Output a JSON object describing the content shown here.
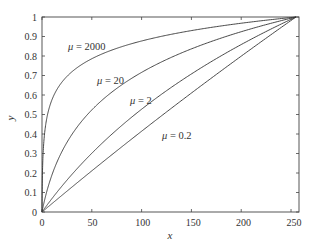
{
  "chart_data": {
    "type": "line",
    "title": "",
    "xlabel": "x",
    "ylabel": "y",
    "xlim": [
      0,
      255
    ],
    "ylim": [
      0,
      1
    ],
    "grid": false,
    "legend": "inline annotations",
    "xticks": [
      "0",
      "50",
      "100",
      "150",
      "200",
      "250"
    ],
    "yticks": [
      "0",
      "0.1",
      "0.2",
      "0.3",
      "0.4",
      "0.5",
      "0.6",
      "0.7",
      "0.8",
      "0.9",
      "1"
    ],
    "formula": "y = ln(1 + mu*x/255) / ln(1 + mu)",
    "series": [
      {
        "name": "μ = 2000",
        "mu": 2000,
        "x": [
          0,
          5,
          25,
          50,
          100,
          150,
          200,
          255
        ],
        "values": [
          0,
          0.49,
          0.68,
          0.76,
          0.85,
          0.9,
          0.97,
          1.0
        ]
      },
      {
        "name": "μ = 20",
        "mu": 20,
        "x": [
          0,
          5,
          25,
          50,
          100,
          150,
          200,
          255
        ],
        "values": [
          0,
          0.11,
          0.35,
          0.52,
          0.71,
          0.83,
          0.92,
          1.0
        ]
      },
      {
        "name": "μ = 2",
        "mu": 2,
        "x": [
          0,
          5,
          25,
          50,
          100,
          150,
          200,
          255
        ],
        "values": [
          0,
          0.04,
          0.17,
          0.31,
          0.53,
          0.7,
          0.86,
          1.0
        ]
      },
      {
        "name": "μ = 0.2",
        "mu": 0.2,
        "x": [
          0,
          5,
          25,
          50,
          100,
          150,
          200,
          255
        ],
        "values": [
          0,
          0.02,
          0.11,
          0.21,
          0.42,
          0.61,
          0.81,
          1.0
        ]
      }
    ],
    "annotations": [
      {
        "mu_symbol": "μ",
        "text": " = 2000"
      },
      {
        "mu_symbol": "μ",
        "text": " = 20"
      },
      {
        "mu_symbol": "μ",
        "text": " = 2"
      },
      {
        "mu_symbol": "μ",
        "text": " = 0.2"
      }
    ]
  }
}
